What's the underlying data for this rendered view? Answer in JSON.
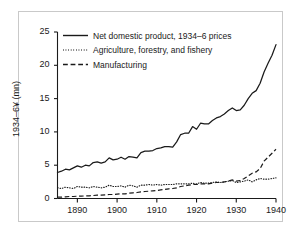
{
  "figure": {
    "frame_border_color": "#c9c9c9",
    "background": "#ffffff",
    "ink_color": "#1a1a1a"
  },
  "chart_data": {
    "type": "line",
    "title": "",
    "subtitle": "",
    "xlabel": "",
    "ylabel": "1934–6¥ (mn)",
    "xlim": [
      1885,
      1940
    ],
    "ylim": [
      0,
      25
    ],
    "grid": false,
    "legend_position": "upper-left",
    "xticks": [
      1890,
      1900,
      1910,
      1920,
      1930,
      1940
    ],
    "yticks": [
      0,
      5,
      10,
      15,
      20,
      25
    ],
    "xtick_labels": [
      "1890",
      "1900",
      "1910",
      "1920",
      "1930",
      "1940"
    ],
    "ytick_labels": [
      "0",
      "5",
      "10",
      "15",
      "20",
      "25"
    ],
    "x": [
      1885,
      1886,
      1887,
      1888,
      1889,
      1890,
      1891,
      1892,
      1893,
      1894,
      1895,
      1896,
      1897,
      1898,
      1899,
      1900,
      1901,
      1902,
      1903,
      1904,
      1905,
      1906,
      1907,
      1908,
      1909,
      1910,
      1911,
      1912,
      1913,
      1914,
      1915,
      1916,
      1917,
      1918,
      1919,
      1920,
      1921,
      1922,
      1923,
      1924,
      1925,
      1926,
      1927,
      1928,
      1929,
      1930,
      1931,
      1932,
      1933,
      1934,
      1935,
      1936,
      1937,
      1938,
      1939,
      1940
    ],
    "series": [
      {
        "name": "Net domestic product, 1934–6 prices",
        "style": "solid",
        "values": [
          3.9,
          4.1,
          4.4,
          4.3,
          4.6,
          4.9,
          4.7,
          5.0,
          4.9,
          5.4,
          5.5,
          5.3,
          5.5,
          6.1,
          5.8,
          5.9,
          6.2,
          5.9,
          6.3,
          6.2,
          6.1,
          6.9,
          7.1,
          7.1,
          7.2,
          7.5,
          7.6,
          7.8,
          7.8,
          7.7,
          8.5,
          9.6,
          9.8,
          9.8,
          10.8,
          10.4,
          11.3,
          11.2,
          11.2,
          11.7,
          12.1,
          12.3,
          12.7,
          13.2,
          13.6,
          13.2,
          13.3,
          14.0,
          15.0,
          15.8,
          16.2,
          17.3,
          19.0,
          20.3,
          21.5,
          23.1
        ]
      },
      {
        "name": "Agriculture, forestry, and fishery",
        "style": "dotted",
        "values": [
          1.6,
          1.5,
          1.7,
          1.6,
          1.5,
          1.8,
          1.7,
          1.7,
          1.6,
          1.8,
          1.7,
          1.6,
          1.7,
          2.0,
          1.8,
          1.8,
          1.9,
          1.7,
          2.0,
          1.9,
          1.7,
          2.0,
          2.0,
          2.1,
          2.0,
          2.1,
          2.0,
          2.1,
          2.1,
          2.1,
          2.2,
          2.2,
          2.2,
          2.2,
          2.3,
          2.2,
          2.4,
          2.3,
          2.3,
          2.4,
          2.5,
          2.4,
          2.5,
          2.6,
          2.7,
          2.4,
          2.5,
          2.6,
          2.8,
          2.5,
          2.8,
          3.0,
          2.9,
          2.9,
          3.0,
          3.1
        ]
      },
      {
        "name": "Manufacturing",
        "style": "dashed",
        "values": [
          0.2,
          0.2,
          0.25,
          0.3,
          0.3,
          0.35,
          0.35,
          0.4,
          0.4,
          0.45,
          0.5,
          0.5,
          0.55,
          0.6,
          0.6,
          0.65,
          0.7,
          0.7,
          0.8,
          0.85,
          0.9,
          1.0,
          1.05,
          1.1,
          1.15,
          1.2,
          1.3,
          1.35,
          1.45,
          1.5,
          1.6,
          1.8,
          1.9,
          2.0,
          2.1,
          2.1,
          2.2,
          2.2,
          2.2,
          2.3,
          2.4,
          2.4,
          2.5,
          2.6,
          2.8,
          2.6,
          2.7,
          3.0,
          3.4,
          3.8,
          4.0,
          4.5,
          5.6,
          6.2,
          6.8,
          7.4
        ]
      }
    ]
  },
  "legend": {
    "items": [
      {
        "label": "Net domestic product, 1934–6 prices",
        "style": "solid"
      },
      {
        "label": "Agriculture, forestry, and fishery",
        "style": "dotted"
      },
      {
        "label": "Manufacturing",
        "style": "dashed"
      }
    ]
  }
}
